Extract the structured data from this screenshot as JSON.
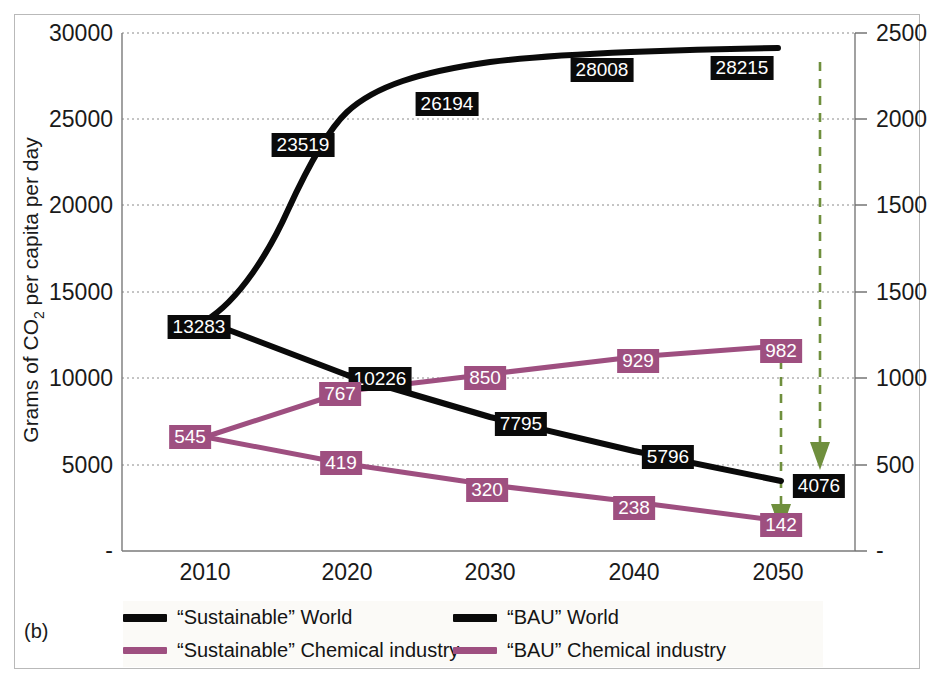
{
  "panel": {
    "label": "(b)"
  },
  "axes": {
    "left": {
      "title": "Grams of CO2 per capita per day",
      "title_parts": {
        "pre": "Grams of CO",
        "sub": "2",
        "post": " per capita per day"
      },
      "ticks": [
        "30000",
        "25000",
        "20000",
        "15000",
        "10000",
        "5000",
        "-"
      ],
      "min": 0,
      "max": 30000
    },
    "right": {
      "ticks": [
        "2500",
        "2000",
        "1500",
        "1000",
        "500",
        "-"
      ],
      "min": 0,
      "max": 2500
    },
    "bottom": {
      "ticks": [
        "2010",
        "2020",
        "2030",
        "2040",
        "2050"
      ]
    }
  },
  "colors": {
    "world": "#0a0a0a",
    "chemical": "#9e4f80",
    "arrow": "#6f8f3d",
    "grid": "#8a8a8a",
    "frame": "#b9b9b9",
    "legend_bg": "#fbfaf7"
  },
  "legend": {
    "rows": [
      [
        {
          "label": "“Sustainable” World",
          "color": "#0a0a0a",
          "name": "legend-sustainable-world"
        },
        {
          "label": "“BAU” World",
          "color": "#0a0a0a",
          "name": "legend-bau-world"
        }
      ],
      [
        {
          "label": "“Sustainable” Chemical industry",
          "color": "#9e4f80",
          "name": "legend-sustainable-chemical"
        },
        {
          "label": "“BAU” Chemical industry",
          "color": "#9e4f80",
          "name": "legend-bau-chemical"
        }
      ]
    ]
  },
  "annotations": {
    "arrows": [
      {
        "name": "arrow-chemical-reduction",
        "x": 781,
        "y_top": 352,
        "y_bottom": 526
      },
      {
        "name": "arrow-world-reduction",
        "x": 820,
        "y_top": 62,
        "y_bottom": 478
      }
    ]
  },
  "chart_data": {
    "type": "line",
    "title": "",
    "xlabel": "",
    "ylabel": "Grams of CO2 per capita per day",
    "x": [
      2010,
      2020,
      2030,
      2040,
      2050
    ],
    "xlim": [
      2006,
      2054
    ],
    "ylim": [
      0,
      30000
    ],
    "ylim_right": [
      0,
      2500
    ],
    "grid": true,
    "legend_position": "bottom",
    "series": [
      {
        "name": "“BAU” World",
        "axis": "left",
        "color": "#0a0a0a",
        "values": [
          13283,
          23519,
          26194,
          28008,
          28215
        ],
        "labels": [
          "13283",
          "23519",
          "26194",
          "28008",
          "28215"
        ],
        "smooth": true
      },
      {
        "name": "“Sustainable” World",
        "axis": "left",
        "color": "#0a0a0a",
        "values": [
          13283,
          10226,
          7795,
          5796,
          4076
        ],
        "labels": [
          "13283",
          "10226",
          "7795",
          "5796",
          "4076"
        ],
        "smooth": false
      },
      {
        "name": "“BAU” Chemical industry",
        "axis": "right",
        "color": "#9e4f80",
        "values": [
          545,
          767,
          850,
          929,
          982
        ],
        "labels": [
          "545",
          "767",
          "850",
          "929",
          "982"
        ],
        "smooth": false
      },
      {
        "name": "“Sustainable” Chemical industry",
        "axis": "right",
        "color": "#9e4f80",
        "values": [
          545,
          419,
          320,
          238,
          142
        ],
        "labels": [
          "545",
          "419",
          "320",
          "238",
          "142"
        ],
        "smooth": false
      }
    ]
  },
  "data_labels": [
    {
      "text": "13283",
      "style": "black",
      "x": 199,
      "y": 327,
      "name": "data-label-world-2010"
    },
    {
      "text": "23519",
      "style": "black",
      "x": 303,
      "y": 145,
      "name": "data-label-bau-world-2020"
    },
    {
      "text": "26194",
      "style": "black",
      "x": 447,
      "y": 104,
      "name": "data-label-bau-world-2030"
    },
    {
      "text": "28008",
      "style": "black",
      "x": 602,
      "y": 70,
      "name": "data-label-bau-world-2040"
    },
    {
      "text": "28215",
      "style": "black",
      "x": 742,
      "y": 68,
      "name": "data-label-bau-world-2050"
    },
    {
      "text": "10226",
      "style": "black",
      "x": 380,
      "y": 379,
      "name": "data-label-sus-world-2020"
    },
    {
      "text": "7795",
      "style": "black",
      "x": 521,
      "y": 424,
      "name": "data-label-sus-world-2030"
    },
    {
      "text": "5796",
      "style": "black",
      "x": 668,
      "y": 457,
      "name": "data-label-sus-world-2040"
    },
    {
      "text": "4076",
      "style": "black",
      "x": 819,
      "y": 486,
      "name": "data-label-sus-world-2050"
    },
    {
      "text": "545",
      "style": "purple",
      "x": 190,
      "y": 437,
      "name": "data-label-chem-2010"
    },
    {
      "text": "767",
      "style": "purple",
      "x": 340,
      "y": 394,
      "name": "data-label-bau-chem-2020"
    },
    {
      "text": "850",
      "style": "purple",
      "x": 485,
      "y": 378,
      "name": "data-label-bau-chem-2030"
    },
    {
      "text": "929",
      "style": "purple",
      "x": 638,
      "y": 361,
      "name": "data-label-bau-chem-2040"
    },
    {
      "text": "982",
      "style": "purple",
      "x": 781,
      "y": 351,
      "name": "data-label-bau-chem-2050"
    },
    {
      "text": "419",
      "style": "purple",
      "x": 341,
      "y": 463,
      "name": "data-label-sus-chem-2020"
    },
    {
      "text": "320",
      "style": "purple",
      "x": 487,
      "y": 490,
      "name": "data-label-sus-chem-2030"
    },
    {
      "text": "238",
      "style": "purple",
      "x": 634,
      "y": 508,
      "name": "data-label-sus-chem-2040"
    },
    {
      "text": "142",
      "style": "purple",
      "x": 781,
      "y": 525,
      "name": "data-label-sus-chem-2050"
    }
  ]
}
